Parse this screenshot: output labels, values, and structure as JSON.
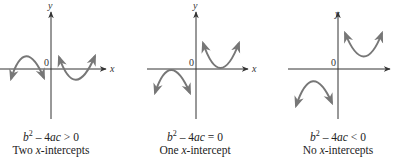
{
  "panels": [
    {
      "id": "two-intercepts",
      "condition": {
        "lhs": "b",
        "exp": "2",
        "rest": " – 4",
        "ac": "ac",
        "rel": " > 0"
      },
      "description": {
        "pre": "Two ",
        "x": "x",
        "post": "-intercepts"
      },
      "axis_labels": {
        "x": "x",
        "y": "y",
        "origin": "0"
      }
    },
    {
      "id": "one-intercept",
      "condition": {
        "lhs": "b",
        "exp": "2",
        "rest": " – 4",
        "ac": "ac",
        "rel": " = 0"
      },
      "description": {
        "pre": "One ",
        "x": "x",
        "post": "-intercept"
      },
      "axis_labels": {
        "x": "x",
        "y": "y",
        "origin": "0"
      }
    },
    {
      "id": "no-intercepts",
      "condition": {
        "lhs": "b",
        "exp": "2",
        "rest": " – 4",
        "ac": "ac",
        "rel": " < 0"
      },
      "description": {
        "pre": "No ",
        "x": "x",
        "post": "-intercepts"
      },
      "axis_labels": {
        "x": "x",
        "y": "y",
        "origin": "0"
      }
    }
  ],
  "colors": {
    "axis": "#333333",
    "curve": "#777777"
  }
}
